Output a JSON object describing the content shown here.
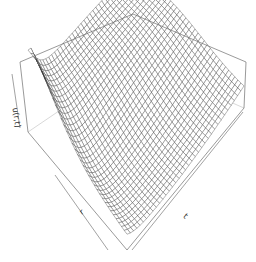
{
  "chart_data": {
    "type": "surface3d",
    "title": "",
    "zlabel": "u(r,t)",
    "xlabel": "r",
    "ylabel": "t",
    "grid": "wireframe mesh, ~40 x 40 facets",
    "box": true,
    "ticks": false,
    "view": {
      "theta_deg": -45,
      "phi_deg": 35
    },
    "colors": {
      "mesh_line": "#2b2b2b",
      "box": "#6e6e6e",
      "background": "#ffffff"
    }
  },
  "labels": {
    "z_axis": "u(r,t)",
    "x_axis": "r",
    "y_axis": "t"
  }
}
